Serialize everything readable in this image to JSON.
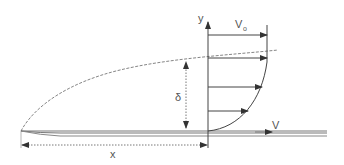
{
  "diagram": {
    "labels": {
      "y_axis": "y",
      "free_stream_velocity": "V",
      "free_stream_subscript": "o",
      "plate_velocity": "V",
      "thickness": "δ",
      "distance": "x"
    },
    "colors": {
      "line": "#555555",
      "plate": "#777777",
      "dashed": "#666666",
      "background": "#ffffff"
    }
  }
}
